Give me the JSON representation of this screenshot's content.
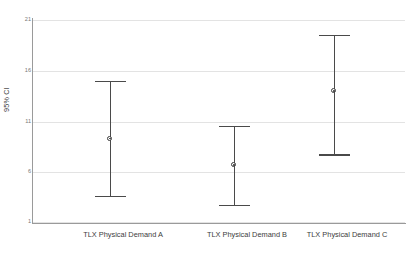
{
  "chart_data": {
    "type": "scatter",
    "title": "",
    "subtitle": "",
    "xlabel": "",
    "ylabel": "95% CI",
    "categories": [
      "TLX Physical Demand A",
      "TLX Physical Demand B",
      "TLX Physical Demand C"
    ],
    "values": [
      9.3,
      6.7,
      14.0
    ],
    "ci_lower": [
      3.6,
      2.7,
      7.7
    ],
    "ci_upper": [
      15.0,
      10.5,
      19.5
    ],
    "series": [
      {
        "name": "95% CI",
        "points": [
          {
            "category": "TLX Physical Demand A",
            "mean": 9.3,
            "lower": 3.6,
            "upper": 15.0
          },
          {
            "category": "TLX Physical Demand B",
            "mean": 6.7,
            "lower": 2.7,
            "upper": 10.5
          },
          {
            "category": "TLX Physical Demand C",
            "mean": 14.0,
            "lower": 7.7,
            "upper": 19.5
          }
        ]
      }
    ],
    "ylim": [
      1,
      21
    ],
    "yticks": [
      1,
      6,
      11,
      16,
      21
    ],
    "ytick_labels": [
      "1",
      "6",
      "11",
      "16",
      "21"
    ],
    "grid": true,
    "grid_axis": "y",
    "legend": false,
    "legend_position": "none",
    "marker": "circle-with-dot",
    "errorbar_style": "capped-vertical",
    "colors": {
      "errorbar": "#4a4a4a",
      "marker_fill": "#ffffff",
      "marker_edge": "#3a3a3a",
      "gridline": "#e3e3e3",
      "axis": "#9a9a9a",
      "text": "#3c3c3c",
      "tick_text": "#787878",
      "background": "#ffffff"
    }
  },
  "caption": {
    "text": ""
  }
}
